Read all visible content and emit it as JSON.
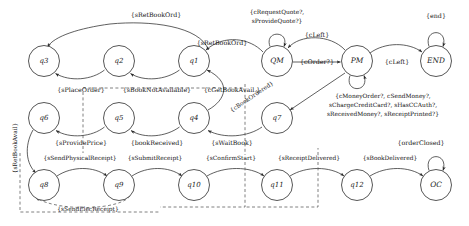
{
  "diagram": {
    "type": "finite-state-machine",
    "title": "",
    "colors": {
      "stroke": "#2b2b2b",
      "dashed_stroke": "#555555",
      "text": "#151515",
      "background": "#ffffff"
    },
    "states": [
      {
        "id": "q3",
        "label": "q3",
        "cx": 44,
        "cy": 61,
        "r": 15.5,
        "shape": "circle"
      },
      {
        "id": "q2",
        "label": "q2",
        "cx": 119,
        "cy": 61,
        "r": 15.5,
        "shape": "circle"
      },
      {
        "id": "q1",
        "label": "q1",
        "cx": 194,
        "cy": 61,
        "r": 15.5,
        "shape": "circle"
      },
      {
        "id": "QM",
        "label": "QM",
        "cx": 277,
        "cy": 61,
        "r": 15.5,
        "shape": "circle"
      },
      {
        "id": "PM",
        "label": "PM",
        "cx": 357,
        "cy": 61,
        "r": 15.5,
        "shape": "circle"
      },
      {
        "id": "END",
        "label": "END",
        "cx": 436,
        "cy": 61,
        "r": 15.5,
        "shape": "circle"
      },
      {
        "id": "q6",
        "label": "q6",
        "cx": 44,
        "cy": 118,
        "r": 15.5,
        "shape": "circle"
      },
      {
        "id": "q5",
        "label": "q5",
        "cx": 119,
        "cy": 118,
        "r": 15.5,
        "shape": "circle"
      },
      {
        "id": "q4",
        "label": "q4",
        "cx": 194,
        "cy": 118,
        "r": 15.5,
        "shape": "circle"
      },
      {
        "id": "q7",
        "label": "q7",
        "cx": 277,
        "cy": 118,
        "r": 15.5,
        "shape": "circle"
      },
      {
        "id": "q8",
        "label": "q8",
        "cx": 44,
        "cy": 185,
        "r": 15.5,
        "shape": "circle"
      },
      {
        "id": "q9",
        "label": "q9",
        "cx": 119,
        "cy": 185,
        "r": 15.5,
        "shape": "circle"
      },
      {
        "id": "q10",
        "label": "q10",
        "cx": 194,
        "cy": 185,
        "r": 15.5,
        "shape": "circle"
      },
      {
        "id": "q11",
        "label": "q11",
        "cx": 277,
        "cy": 185,
        "r": 15.5,
        "shape": "circle"
      },
      {
        "id": "q12",
        "label": "q12",
        "cx": 357,
        "cy": 185,
        "r": 15.5,
        "shape": "circle"
      },
      {
        "id": "OC",
        "label": "OC",
        "cx": 436,
        "cy": 185,
        "r": 15.5,
        "shape": "circle"
      }
    ],
    "transitions": [
      {
        "id": "t1",
        "from": "q3",
        "to": "q1",
        "label": "{sRetBookOrd}",
        "label_x": 156,
        "label_y": 15,
        "style": "solid"
      },
      {
        "id": "t2",
        "from": "q2",
        "to": "q3",
        "label": "{sPlaceOrder}",
        "label_x": 81,
        "label_y": 90,
        "style": "solid"
      },
      {
        "id": "t3",
        "from": "q1",
        "to": "q2",
        "label": "{sBookNotAvailable}",
        "label_x": 157,
        "label_y": 90,
        "style": "solid"
      },
      {
        "id": "t4",
        "from": "QM",
        "to": "q1",
        "label": "{sRetBookOrd}",
        "label_x": 222,
        "label_y": 43,
        "style": "solid"
      },
      {
        "id": "t5",
        "from": "q4",
        "to": "q1",
        "label": "{cGetBookAvail.}",
        "label_x": 232,
        "label_y": 90,
        "style": "solid"
      },
      {
        "id": "t6",
        "from": "QM",
        "to": "QM",
        "label": "{cRequestQuote?, sProvideQuote?}",
        "label_x": 277,
        "label_y": 16,
        "style": "self-loop"
      },
      {
        "id": "t7",
        "from": "QM",
        "to": "PM",
        "label": "{cOrder?}",
        "label_x": 317,
        "label_y": 61,
        "style": "solid"
      },
      {
        "id": "t8",
        "from": "PM",
        "to": "QM",
        "label": "{cLeft}",
        "label_x": 317,
        "label_y": 35,
        "style": "solid"
      },
      {
        "id": "t9",
        "from": "PM",
        "to": "END",
        "label": "{cLeft}",
        "label_x": 397,
        "label_y": 61,
        "style": "solid"
      },
      {
        "id": "t10",
        "from": "END",
        "to": "END",
        "label": "{end}",
        "label_x": 436,
        "label_y": 16,
        "style": "self-loop"
      },
      {
        "id": "t11",
        "from": "PM",
        "to": "PM",
        "label": "{cMoneyOrder?, cSendMoney?, sChargeCreditCard?, sHasCCAuth?, sReceivedMoney?, sReceiptPrinted?}",
        "label_x": 383,
        "label_y": 103,
        "style": "self-loop"
      },
      {
        "id": "t12",
        "from": "PM",
        "to": "q7",
        "label": "{cBookOrdered}",
        "label_x": 252,
        "label_y": 97,
        "style": "solid-diagonal"
      },
      {
        "id": "t13",
        "from": "q5",
        "to": "q6",
        "label": "{sProvidePrice}",
        "label_x": 81,
        "label_y": 143,
        "style": "solid"
      },
      {
        "id": "t14",
        "from": "q4",
        "to": "q5",
        "label": "{bookReceived}",
        "label_x": 157,
        "label_y": 143,
        "style": "solid"
      },
      {
        "id": "t15",
        "from": "q7",
        "to": "q4",
        "label": "{sWaitBook}",
        "label_x": 232,
        "label_y": 143,
        "style": "solid"
      },
      {
        "id": "t16",
        "from": "q6",
        "to": "q8",
        "label": "{sRetBookAvail}",
        "label_x": 17,
        "label_y": 150,
        "style": "solid-vertical",
        "rotate": -90
      },
      {
        "id": "t17",
        "from": "q8",
        "to": "q9",
        "label": "{sSendPhysicalReceipt}",
        "label_x": 80,
        "label_y": 158,
        "style": "solid"
      },
      {
        "id": "t18",
        "from": "q9",
        "to": "q10",
        "label": "{sSubmitReceipt}",
        "label_x": 152,
        "label_y": 158,
        "style": "solid"
      },
      {
        "id": "t19",
        "from": "q10",
        "to": "q11",
        "label": "{sConfirmStart}",
        "label_x": 230,
        "label_y": 158,
        "style": "solid"
      },
      {
        "id": "t20",
        "from": "q11",
        "to": "q12",
        "label": "{sReceiptDelivered}",
        "label_x": 310,
        "label_y": 158,
        "style": "solid"
      },
      {
        "id": "t21",
        "from": "q12",
        "to": "OC",
        "label": "{sBookDelivered}",
        "label_x": 391,
        "label_y": 158,
        "style": "solid"
      },
      {
        "id": "t22",
        "from": "OC",
        "to": "OC",
        "label": "{orderClosed}",
        "label_x": 421,
        "label_y": 143,
        "style": "self-loop"
      },
      {
        "id": "t23",
        "from": "q9",
        "to": "q8",
        "label": "{sSendElecReceipt}",
        "label_x": 88,
        "label_y": 209,
        "style": "dashed"
      }
    ]
  }
}
